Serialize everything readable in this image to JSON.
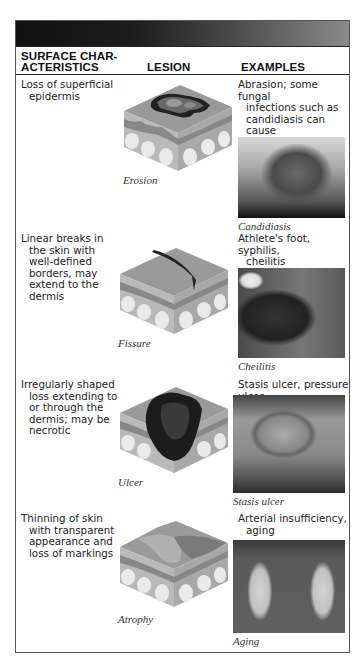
{
  "header": {
    "col1_line1": "SURFACE CHAR-",
    "col1_line2": "ACTERISTICS",
    "col2": "LESION",
    "col3": "EXAMPLES"
  },
  "rows": [
    {
      "characteristics": [
        "Loss of superficial",
        "epidermis"
      ],
      "lesion_caption": "Erosion",
      "examples": [
        "Abrasion; some fungal",
        "infections such as",
        "candidiasis can cause",
        "erosion"
      ],
      "photo_caption": "Candidiasis"
    },
    {
      "characteristics": [
        "Linear breaks in",
        "the skin with",
        "well-defined",
        "borders, may",
        "extend to the",
        "dermis"
      ],
      "lesion_caption": "Fissure",
      "examples": [
        "Athlete's foot, syphilis,",
        "cheilitis"
      ],
      "photo_caption": "Cheilitis"
    },
    {
      "characteristics": [
        "Irregularly shaped",
        "loss extending to",
        "or through the",
        "dermis; may be",
        "necrotic"
      ],
      "lesion_caption": "Ulcer",
      "examples": [
        "Stasis ulcer, pressure ulcer"
      ],
      "photo_caption": "Stasis ulcer"
    },
    {
      "characteristics": [
        "Thinning of skin",
        "with transparent",
        "appearance and",
        "loss of markings"
      ],
      "lesion_caption": "Atrophy",
      "examples": [
        "Arterial insufficiency,",
        "aging"
      ],
      "photo_caption": "Aging"
    }
  ]
}
